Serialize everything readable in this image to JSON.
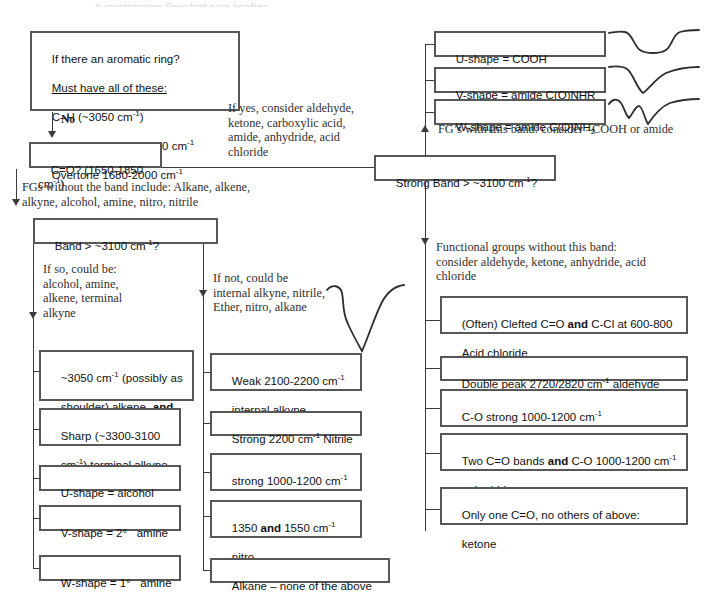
{
  "top_cropped_text": "ir spectroscopy flowchart page heading",
  "decision_boxes": {
    "aromatic": {
      "line1": "If there an aromatic ring?",
      "line2": "Must have all of these:",
      "line3_pre": "C–H (~3050 cm",
      "line3_sup": "-1",
      "line3_post": ")",
      "line4_pre": "C=C ~1600 and ~1500 cm",
      "line4_sup": "-1",
      "line5_pre": "Overtone 1680-2000 cm",
      "line5_sup": "-1"
    },
    "carbonyl": {
      "pre": "C=O? (1650-1850 cm",
      "sup": "-1",
      "post": ")"
    },
    "band_left": {
      "pre": "Band > ~3100 cm",
      "sup": "-1",
      "post": "?"
    },
    "strong_band": {
      "pre": "Strong Band > ~3100 cm",
      "sup": "-1",
      "post": "?"
    }
  },
  "edge_labels": {
    "no": "No"
  },
  "notes": {
    "if_yes": "If yes, consider aldehyde,\nketone, carboxylic acid,\namide, anhydride, acid\nchloride",
    "fgs_without_band": "FGs without the band include: Alkane, alkene,\nalkyne, alcohol, amine, nitro, nitrile",
    "if_so": "If so, could be:\nalcohol, amine,\nalkene, terminal\nalkyne",
    "if_not": "If not, could be\ninternal alkyne, nitrile,\nEther, nitro, alkane",
    "fgs_with_band": "FG’s with this band: consider –COOH or amide",
    "fgs_without_this_band": "Functional groups without this band:\nconsider aldehyde, ketone, anhydride, acid\nchloride"
  },
  "top_right_results": [
    {
      "id": "u-shape-cooh",
      "text": "U-shape = COOH",
      "curve": "u-shape-curve"
    },
    {
      "id": "v-shape-amide-nhr",
      "text": "V-shape = amide C(O)NHR",
      "curve": "v-shape-curve"
    },
    {
      "id": "w-shape-amide-nh2",
      "pre": "W-shape = amide C(O)NH",
      "sub": "2",
      "curve": "w-shape-curve"
    }
  ],
  "left_results": [
    {
      "id": "alkene-3050",
      "html_lines": [
        {
          "pre": "~3050 cm",
          "sup": "-1",
          "post": " (possibly as"
        },
        {
          "pre": "shoulder) alkene- ",
          "bold": "and",
          "post": ""
        },
        {
          "pre": "C=C at ~1650 cm",
          "sup": "-1",
          "post": ""
        }
      ]
    },
    {
      "id": "terminal-alkyne",
      "html_lines": [
        {
          "pre": "Sharp (~3300-3100",
          "post": ""
        },
        {
          "pre": "cm",
          "sup": "-1",
          "post": ") terminal alkyne"
        }
      ]
    },
    {
      "id": "u-shape-alcohol",
      "html_lines": [
        {
          "pre": "U-shape = alcohol",
          "post": ""
        }
      ]
    },
    {
      "id": "v-shape-secondary-amine",
      "html_lines": [
        {
          "pre": "V-shape = 2°   amine",
          "post": ""
        }
      ]
    },
    {
      "id": "w-shape-primary-amine",
      "html_lines": [
        {
          "pre": "W-shape = 1°   amine",
          "post": ""
        }
      ]
    }
  ],
  "middle_results": [
    {
      "id": "internal-alkyne",
      "html_lines": [
        {
          "pre": "Weak 2100-2200 cm",
          "sup": "-1",
          "post": ""
        },
        {
          "pre": "internal alkyne",
          "post": ""
        }
      ]
    },
    {
      "id": "nitrile",
      "html_lines": [
        {
          "pre": "Strong 2200 cm",
          "sup": "-1",
          "post": " Nitrile"
        }
      ]
    },
    {
      "id": "ether",
      "html_lines": [
        {
          "pre": "strong 1000-1200 cm",
          "sup": "-1",
          "post": ""
        },
        {
          "pre": "ether",
          "post": ""
        }
      ]
    },
    {
      "id": "nitro",
      "html_lines": [
        {
          "pre": "1350 ",
          "bold": "and",
          "post": " 1550 cm",
          "sup": "-1"
        },
        {
          "pre": "nitro",
          "post": ""
        }
      ]
    },
    {
      "id": "alkane",
      "html_lines": [
        {
          "pre": "Alkane – none of the above",
          "post": ""
        }
      ]
    }
  ],
  "right_results": [
    {
      "id": "acid-chloride",
      "html_lines": [
        {
          "pre": "(Often) Clefted C=O ",
          "bold": "and",
          "post": " C-Cl at 600-800"
        },
        {
          "pre": "Acid chloride",
          "post": ""
        }
      ]
    },
    {
      "id": "aldehyde",
      "html_lines": [
        {
          "pre": "Double peak 2720/2820 cm",
          "sup": "-1",
          "post": " aldehyde"
        }
      ]
    },
    {
      "id": "ester",
      "html_lines": [
        {
          "pre": "C-O strong 1000-1200 cm",
          "sup": "-1",
          "post": ""
        },
        {
          "pre": "ester",
          "post": ""
        }
      ]
    },
    {
      "id": "anhydride",
      "html_lines": [
        {
          "pre": "Two C=O bands ",
          "bold": "and",
          "post": " C-O 1000-1200 cm",
          "sup": "-1"
        },
        {
          "pre": "anhydride",
          "post": ""
        }
      ]
    },
    {
      "id": "ketone",
      "html_lines": [
        {
          "pre": "Only one C=O, no others of above:",
          "post": ""
        },
        {
          "pre": "ketone",
          "post": ""
        }
      ]
    }
  ],
  "colors": {
    "box_border": "#575757",
    "line": "#3b3b3b",
    "text": "#111111",
    "note_text": "#30302f",
    "background": "#ffffff"
  }
}
